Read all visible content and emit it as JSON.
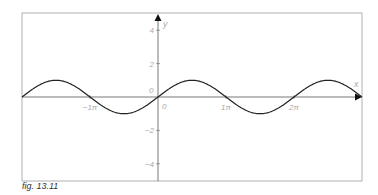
{
  "caption": "fig. 13.11",
  "colors": {
    "frame": "#b0b0b0",
    "axis": "#555555",
    "curve": "#222222",
    "labels": "#aaaaaa"
  },
  "chart_data": {
    "type": "line",
    "title": "",
    "function": "y = sin(x)",
    "xlabel": "x",
    "ylabel": "y",
    "xlim": [
      -6.4,
      9.4
    ],
    "ylim": [
      -5,
      5
    ],
    "x_ticks": [
      {
        "value": -3.14159,
        "label": "−1π"
      },
      {
        "value": 3.14159,
        "label": "1π"
      },
      {
        "value": 6.28318,
        "label": "2π"
      }
    ],
    "y_ticks": [
      {
        "value": 4,
        "label": "4"
      },
      {
        "value": 2,
        "label": "2"
      },
      {
        "value": -2,
        "label": "−2"
      },
      {
        "value": -4,
        "label": "−4"
      }
    ],
    "origin_labels": [
      "0",
      "0"
    ],
    "grid": false,
    "series": [
      {
        "name": "sin(x)",
        "x": [
          -6.28,
          -4.71,
          -3.14,
          -1.57,
          0,
          1.57,
          3.14,
          4.71,
          6.28,
          7.85,
          9.42
        ],
        "values": [
          0,
          1,
          0,
          -1,
          0,
          1,
          0,
          -1,
          0,
          1,
          0
        ]
      }
    ]
  }
}
